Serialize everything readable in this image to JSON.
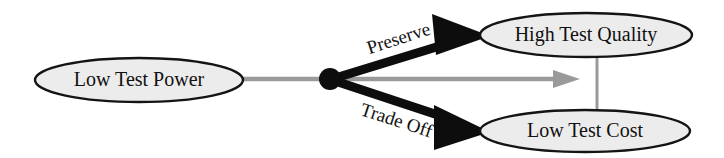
{
  "diagram": {
    "type": "node-link-diagram",
    "background_color": "#ffffff",
    "nodes": [
      {
        "id": "low-test-power",
        "label": "Low Test Power",
        "shape": "ellipse",
        "cx": 139,
        "cy": 80,
        "rx": 104,
        "ry": 22,
        "fill": "#ececec",
        "stroke": "#141414"
      },
      {
        "id": "high-test-quality",
        "label": "High Test Quality",
        "shape": "ellipse",
        "cx": 586,
        "cy": 35,
        "rx": 106,
        "ry": 22,
        "fill": "#ececec",
        "stroke": "#141414"
      },
      {
        "id": "low-test-cost",
        "label": "Low Test Cost",
        "shape": "ellipse",
        "cx": 585,
        "cy": 131,
        "rx": 105,
        "ry": 21,
        "fill": "#ececec",
        "stroke": "#141414"
      }
    ],
    "junction": {
      "id": "branch-point",
      "cx": 330,
      "cy": 79,
      "r": 11,
      "color": "#0d0d0d"
    },
    "edges": [
      {
        "id": "preserve-edge",
        "label": "Preserve",
        "from": "branch-point",
        "to": "high-test-quality",
        "style": "thick-black-arrow",
        "color": "#0d0d0d",
        "label_rotation_deg": -18
      },
      {
        "id": "trade-off-edge",
        "label": "Trade Off",
        "from": "branch-point",
        "to": "low-test-cost",
        "style": "thick-black-arrow",
        "color": "#0d0d0d",
        "label_rotation_deg": 18
      },
      {
        "id": "gray-horizontal-edge",
        "label": "",
        "from": "low-test-power",
        "to": "gray-connector",
        "style": "gray-arrow",
        "color": "#9a9a9a"
      },
      {
        "id": "gray-connector-edge",
        "label": "",
        "from": "high-test-quality",
        "to": "low-test-cost",
        "style": "gray-line",
        "color": "#9a9a9a"
      }
    ]
  }
}
